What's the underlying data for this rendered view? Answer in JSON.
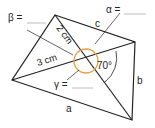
{
  "diagram": {
    "labels": {
      "beta": "β =",
      "alpha": "α =",
      "gamma": "γ =",
      "side_a": "a",
      "side_b": "b",
      "side_c": "c",
      "diag_2cm": "2 cm",
      "diag_3cm": "3 cm",
      "angle_70": "70°"
    },
    "colors": {
      "lines": "#222222",
      "circle": "#e8a040",
      "blank": "#aaaaaa"
    }
  }
}
